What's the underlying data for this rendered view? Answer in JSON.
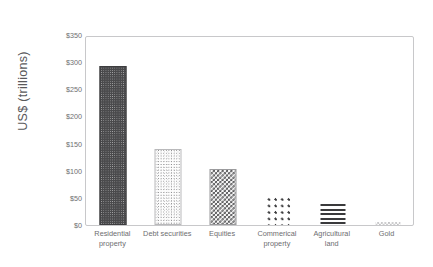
{
  "chart_data": {
    "type": "bar",
    "title": "",
    "subtitle": "",
    "xlabel": "",
    "ylabel": "US$ (trillions)",
    "categories": [
      "Residential property",
      "Debt securities",
      "Equities",
      "Commerical property",
      "Agricultural land",
      "Gold"
    ],
    "category_lines": [
      [
        "Residential",
        "property"
      ],
      [
        "Debt securities",
        ""
      ],
      [
        "Equities",
        ""
      ],
      [
        "Commerical",
        "property"
      ],
      [
        "Agricultural",
        "land"
      ],
      [
        "Gold",
        ""
      ]
    ],
    "values": [
      290,
      136,
      100,
      54,
      38,
      6
    ],
    "ylim": [
      0,
      350
    ],
    "ytick_values": [
      0,
      50,
      100,
      150,
      200,
      250,
      300,
      350
    ],
    "ytick_labels": [
      "$0",
      "$50",
      "$100",
      "$150",
      "$200",
      "$250",
      "$300",
      "$350"
    ],
    "grid": false,
    "legend": false,
    "legend_position": "none",
    "bar_patterns": [
      "dense-dark-dots",
      "light-stipple",
      "checkerboard",
      "sparse-dot-grid",
      "horizontal-stripes",
      "faint-checker"
    ]
  },
  "style": {
    "background": "#ffffff",
    "plot_border": "#c8c8ca",
    "tick_text": "#6e6e70",
    "axis_title_text": "#59595b",
    "bar_dark": "#4a4a4c"
  }
}
